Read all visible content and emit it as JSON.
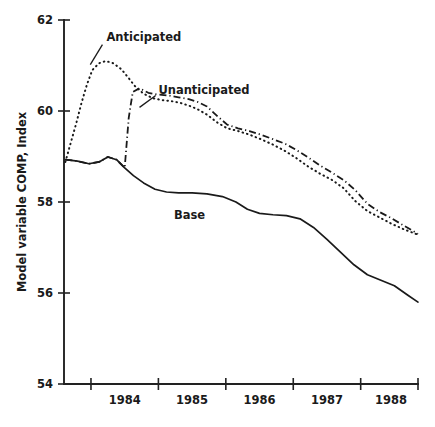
{
  "chart_data": {
    "type": "line",
    "title": "",
    "xlabel": "",
    "ylabel": "Model variable COMP, Index",
    "ylim": [
      54,
      62
    ],
    "xlim": [
      1983.6,
      1988.85
    ],
    "yticks": [
      54,
      56,
      58,
      60,
      62
    ],
    "ytick_labels": [
      "54",
      "56",
      "58",
      "60",
      "62"
    ],
    "xticks": [
      1984.0,
      1985.0,
      1986.0,
      1987.0,
      1988.0
    ],
    "xtick_labels": [
      "1984",
      "1985",
      "1986",
      "1987",
      "1988"
    ],
    "xtick_label_positions": [
      1984.5,
      1985.5,
      1986.5,
      1987.5,
      1988.45
    ],
    "grid": false,
    "legend_position": "inline-annotations",
    "series": [
      {
        "name": "Base",
        "style": "solid",
        "label_x": 1985.23,
        "label_y": 57.72,
        "x": [
          1983.62,
          1983.8,
          1983.97,
          1984.12,
          1984.25,
          1984.38,
          1984.5,
          1984.63,
          1984.78,
          1984.95,
          1985.12,
          1985.3,
          1985.5,
          1985.72,
          1985.95,
          1986.15,
          1986.32,
          1986.5,
          1986.7,
          1986.9,
          1987.1,
          1987.3,
          1987.5,
          1987.7,
          1987.9,
          1988.1,
          1988.3,
          1988.5,
          1988.7,
          1988.85
        ],
        "y": [
          58.93,
          58.9,
          58.84,
          58.88,
          58.99,
          58.93,
          58.75,
          58.58,
          58.42,
          58.28,
          58.22,
          58.2,
          58.2,
          58.18,
          58.12,
          58.0,
          57.84,
          57.75,
          57.72,
          57.7,
          57.63,
          57.44,
          57.18,
          56.9,
          56.62,
          56.4,
          56.28,
          56.16,
          55.95,
          55.8
        ]
      },
      {
        "name": "Anticipated",
        "style": "dotted",
        "label_x": 1984.23,
        "label_y": 61.62,
        "leader": {
          "x1": 1984.17,
          "y1": 61.46,
          "x2": 1983.99,
          "y2": 61.02
        },
        "x": [
          1983.62,
          1983.7,
          1983.78,
          1983.86,
          1983.94,
          1984.02,
          1984.12,
          1984.22,
          1984.33,
          1984.45,
          1984.55,
          1984.65,
          1984.78,
          1984.92,
          1985.05,
          1985.18,
          1985.32,
          1985.45,
          1985.58,
          1985.72,
          1985.88,
          1986.02,
          1986.18,
          1986.35,
          1986.52,
          1986.7,
          1986.88,
          1987.05,
          1987.22,
          1987.4,
          1987.58,
          1987.75,
          1987.92,
          1988.1,
          1988.28,
          1988.46,
          1988.64,
          1988.85
        ],
        "y": [
          58.88,
          59.3,
          59.72,
          60.18,
          60.58,
          60.9,
          61.05,
          61.1,
          61.05,
          60.92,
          60.74,
          60.55,
          60.38,
          60.28,
          60.24,
          60.22,
          60.18,
          60.12,
          60.04,
          59.92,
          59.74,
          59.62,
          59.56,
          59.48,
          59.38,
          59.26,
          59.12,
          58.96,
          58.78,
          58.62,
          58.48,
          58.3,
          58.02,
          57.8,
          57.66,
          57.52,
          57.4,
          57.28
        ]
      },
      {
        "name": "Unanticipated",
        "style": "dashdot",
        "label_x": 1985.0,
        "label_y": 60.46,
        "leader": {
          "x1": 1984.96,
          "y1": 60.34,
          "x2": 1984.72,
          "y2": 60.08
        },
        "x": [
          1983.62,
          1983.8,
          1983.97,
          1984.12,
          1984.25,
          1984.38,
          1984.5,
          1984.56,
          1984.62,
          1984.72,
          1984.85,
          1985.0,
          1985.15,
          1985.3,
          1985.45,
          1985.58,
          1985.72,
          1985.88,
          1986.02,
          1986.18,
          1986.35,
          1986.52,
          1986.7,
          1986.88,
          1987.05,
          1987.22,
          1987.4,
          1987.58,
          1987.75,
          1987.92,
          1988.1,
          1988.28,
          1988.46,
          1988.64,
          1988.85
        ],
        "y": [
          58.93,
          58.9,
          58.84,
          58.88,
          58.99,
          58.93,
          58.75,
          59.85,
          60.42,
          60.5,
          60.4,
          60.36,
          60.34,
          60.3,
          60.26,
          60.2,
          60.1,
          59.88,
          59.7,
          59.62,
          59.56,
          59.48,
          59.38,
          59.28,
          59.14,
          58.98,
          58.8,
          58.64,
          58.48,
          58.26,
          57.96,
          57.78,
          57.64,
          57.48,
          57.3
        ]
      }
    ]
  }
}
